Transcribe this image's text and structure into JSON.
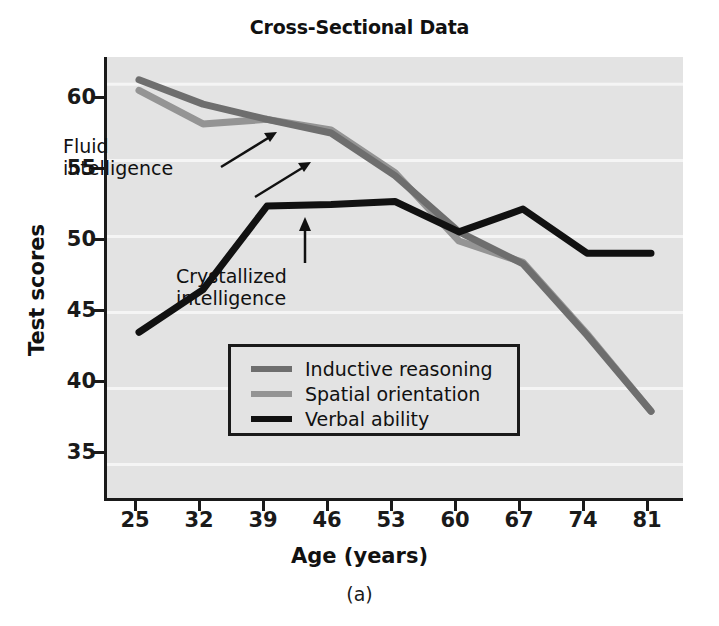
{
  "chart_data": {
    "type": "line",
    "title": "Cross-Sectional Data",
    "caption": "(a)",
    "xlabel": "Age (years)",
    "ylabel": "Test scores",
    "x": [
      25,
      32,
      39,
      46,
      53,
      60,
      67,
      74,
      81
    ],
    "xtick_labels": [
      "25",
      "32",
      "39",
      "46",
      "53",
      "60",
      "67",
      "74",
      "81"
    ],
    "ytick_labels": [
      "35",
      "40",
      "45",
      "50",
      "55",
      "60"
    ],
    "yticks": [
      35,
      40,
      45,
      50,
      55,
      60
    ],
    "xlim": [
      21.5,
      84.5
    ],
    "ylim": [
      32.8,
      61.8
    ],
    "grid": true,
    "grid_color": "#f5f5f5",
    "plot_background": "#e3e3e3",
    "legend_position": "center",
    "series": [
      {
        "name": "Inductive reasoning",
        "color": "#6e6e6e",
        "values": [
          60.3,
          58.7,
          57.7,
          56.8,
          54.0,
          50.3,
          48.2,
          43.5,
          38.5
        ]
      },
      {
        "name": "Spatial orientation",
        "color": "#949494",
        "values": [
          59.6,
          57.4,
          57.7,
          57.0,
          54.2,
          49.7,
          48.3,
          43.6,
          38.5
        ]
      },
      {
        "name": "Verbal ability",
        "color": "#111111",
        "values": [
          43.7,
          46.5,
          52.0,
          52.1,
          52.3,
          50.3,
          51.8,
          48.9,
          48.9
        ]
      }
    ],
    "annotations": [
      {
        "id": "fluid",
        "text": "Fluid\nintelligence",
        "points_to": [
          "Inductive reasoning",
          "Spatial orientation"
        ]
      },
      {
        "id": "crystallized",
        "text": "Crystallized\nintelligence",
        "points_to": [
          "Verbal ability"
        ]
      }
    ]
  }
}
